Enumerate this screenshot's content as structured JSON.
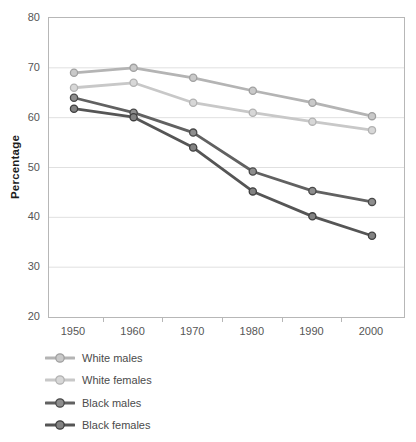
{
  "chart_data": {
    "type": "line",
    "title": "",
    "ylabel": "Percentage",
    "xlabel": "",
    "x": [
      1950,
      1960,
      1970,
      1980,
      1990,
      2000
    ],
    "xticklabels": [
      "1950",
      "1960",
      "1970",
      "1980",
      "1990",
      "2000"
    ],
    "yticks": [
      80,
      70,
      60,
      50,
      40,
      30,
      20
    ],
    "ylim": [
      20,
      80
    ],
    "grid": "horizontal-gridlines-only",
    "legend_position": "bottom-left",
    "series": [
      {
        "name": "White males",
        "values": [
          69,
          70,
          68,
          65.4,
          63,
          60.3
        ],
        "line_color": "#b4b4b4",
        "marker_fill": "#c9c9c9",
        "marker_stroke": "#a0a0a0"
      },
      {
        "name": "White females",
        "values": [
          66,
          67,
          63,
          61,
          59.2,
          57.5
        ],
        "line_color": "#c8c8c8",
        "marker_fill": "#d7d7d7",
        "marker_stroke": "#b2b2b2"
      },
      {
        "name": "Black males",
        "values": [
          64,
          61,
          57,
          49.2,
          45.3,
          43.1
        ],
        "line_color": "#616161",
        "marker_fill": "#8e8e8e",
        "marker_stroke": "#494949",
        "note": "values read from gridlines"
      },
      {
        "name": "Black females",
        "values": [
          61.8,
          60.1,
          54,
          45.2,
          40.2,
          36.3
        ],
        "line_color": "#555555",
        "marker_fill": "#828282",
        "marker_stroke": "#3f3f3f",
        "note": "values read from gridlines"
      }
    ],
    "colors": {
      "background": "#ffffff",
      "plot_border": "#b7b7b7",
      "gridline": "#e0e0e0",
      "tick": "#b7b7b7",
      "axis_text": "#565656",
      "axis_title_text": "#1c1c1c",
      "legend_text": "#4b4b4b"
    }
  }
}
